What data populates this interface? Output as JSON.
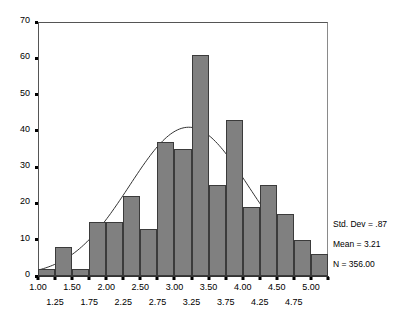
{
  "chart_data": {
    "type": "bar",
    "title": "",
    "subtitle": "",
    "xlabel": "",
    "ylabel": "",
    "xlim": [
      1.0,
      5.25
    ],
    "ylim": [
      0,
      70
    ],
    "grid": false,
    "bin_width": 0.25,
    "categories": [
      "1.00",
      "1.25",
      "1.50",
      "1.75",
      "2.00",
      "2.25",
      "2.50",
      "2.75",
      "3.00",
      "3.25",
      "3.50",
      "3.75",
      "4.00",
      "4.25",
      "4.50",
      "4.75",
      "5.00"
    ],
    "bin_starts": [
      1.0,
      1.25,
      1.5,
      1.75,
      2.0,
      2.25,
      2.5,
      2.75,
      3.0,
      3.25,
      3.5,
      3.75,
      4.0,
      4.25,
      4.5,
      4.75,
      5.0
    ],
    "values": [
      2,
      8,
      2,
      15,
      15,
      22,
      13,
      37,
      35,
      61,
      25,
      43,
      19,
      25,
      17,
      10,
      6
    ],
    "bar_color": "#808080",
    "bar_edge_color": "#3b3b3b",
    "curve_color": "#333333",
    "overlay": {
      "type": "normal_curve",
      "mean": 3.21,
      "std_dev": 0.87,
      "n": 356,
      "peak_value": 41
    },
    "y_ticks": [
      0,
      10,
      20,
      30,
      40,
      50,
      60,
      70
    ],
    "x_ticks_top_row": [
      "1.00",
      "1.50",
      "2.00",
      "2.50",
      "3.00",
      "3.50",
      "4.00",
      "4.50",
      "5.00"
    ],
    "x_ticks_bottom_row": [
      "1.25",
      "1.75",
      "2.25",
      "2.75",
      "3.25",
      "3.75",
      "4.25",
      "4.75"
    ],
    "x_tick_values_top_row": [
      1.0,
      1.5,
      2.0,
      2.5,
      3.0,
      3.5,
      4.0,
      4.5,
      5.0
    ],
    "x_tick_values_bottom_row": [
      1.25,
      1.75,
      2.25,
      2.75,
      3.25,
      3.75,
      4.25,
      4.75
    ],
    "legend_position": "right"
  },
  "statistics": {
    "std_dev_label": "Std. Dev = .87",
    "mean_label": "Mean = 3.21",
    "n_label": "N = 356.00"
  }
}
